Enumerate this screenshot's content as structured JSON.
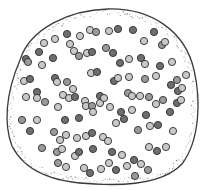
{
  "figure": {
    "width": 204,
    "height": 190,
    "background": "#ffffff",
    "outline": {
      "stroke": "#3a3a3a",
      "stroke_width": 1.3,
      "path": "M 20 60 C 30 28, 70 10, 108 9 C 150 8, 185 30, 194 70 C 201 100, 200 140, 182 164 C 165 182, 130 186, 95 184 C 55 183, 25 172, 12 146 C 4 125, 5 95, 20 60 Z",
      "stipple_color": "#6a6a6a"
    },
    "particle_radius": 3.6,
    "particle_stroke": "#2e2e2e",
    "shades": {
      "light": "#c9c9c9",
      "mid": "#9a9a9a",
      "dark": "#6e6e6e"
    },
    "particles": [
      [
        67,
        34,
        "dark"
      ],
      [
        80,
        36,
        "light"
      ],
      [
        90,
        30,
        "light"
      ],
      [
        96,
        32,
        "mid"
      ],
      [
        109,
        31,
        "light"
      ],
      [
        118,
        29,
        "dark"
      ],
      [
        133,
        30,
        "dark"
      ],
      [
        144,
        41,
        "light"
      ],
      [
        154,
        32,
        "dark"
      ],
      [
        162,
        45,
        "mid"
      ],
      [
        165,
        42,
        "light"
      ],
      [
        44,
        43,
        "light"
      ],
      [
        55,
        39,
        "light"
      ],
      [
        39,
        52,
        "dark"
      ],
      [
        53,
        58,
        "dark"
      ],
      [
        70,
        44,
        "light"
      ],
      [
        74,
        51,
        "light"
      ],
      [
        79,
        56,
        "mid"
      ],
      [
        26,
        59,
        "dark"
      ],
      [
        28,
        62,
        "mid"
      ],
      [
        42,
        65,
        "light"
      ],
      [
        87,
        53,
        "light"
      ],
      [
        92,
        52,
        "dark"
      ],
      [
        106,
        48,
        "mid"
      ],
      [
        113,
        53,
        "dark"
      ],
      [
        120,
        63,
        "dark"
      ],
      [
        129,
        59,
        "light"
      ],
      [
        141,
        58,
        "dark"
      ],
      [
        145,
        64,
        "light"
      ],
      [
        160,
        66,
        "dark"
      ],
      [
        172,
        62,
        "light"
      ],
      [
        24,
        81,
        "light"
      ],
      [
        30,
        79,
        "dark"
      ],
      [
        55,
        78,
        "dark"
      ],
      [
        57,
        82,
        "light"
      ],
      [
        67,
        82,
        "mid"
      ],
      [
        73,
        89,
        "light"
      ],
      [
        91,
        73,
        "light"
      ],
      [
        97,
        72,
        "dark"
      ],
      [
        114,
        81,
        "dark"
      ],
      [
        118,
        78,
        "light"
      ],
      [
        129,
        77,
        "light"
      ],
      [
        145,
        79,
        "mid"
      ],
      [
        156,
        76,
        "light"
      ],
      [
        177,
        80,
        "mid"
      ],
      [
        186,
        75,
        "light"
      ],
      [
        26,
        97,
        "light"
      ],
      [
        37,
        92,
        "dark"
      ],
      [
        37,
        98,
        "light"
      ],
      [
        45,
        102,
        "mid"
      ],
      [
        63,
        95,
        "light"
      ],
      [
        69,
        98,
        "light"
      ],
      [
        75,
        97,
        "dark"
      ],
      [
        85,
        101,
        "light"
      ],
      [
        100,
        96,
        "dark"
      ],
      [
        100,
        103,
        "light"
      ],
      [
        104,
        98,
        "light"
      ],
      [
        128,
        93,
        "mid"
      ],
      [
        132,
        96,
        "light"
      ],
      [
        140,
        96,
        "light"
      ],
      [
        149,
        97,
        "mid"
      ],
      [
        171,
        85,
        "dark"
      ],
      [
        178,
        91,
        "dark"
      ],
      [
        182,
        88,
        "light"
      ],
      [
        22,
        120,
        "mid"
      ],
      [
        37,
        120,
        "light"
      ],
      [
        58,
        107,
        "light"
      ],
      [
        65,
        120,
        "dark"
      ],
      [
        79,
        118,
        "dark"
      ],
      [
        86,
        106,
        "light"
      ],
      [
        92,
        106,
        "mid"
      ],
      [
        93,
        112,
        "light"
      ],
      [
        110,
        107,
        "light"
      ],
      [
        121,
        112,
        "dark"
      ],
      [
        132,
        110,
        "light"
      ],
      [
        146,
        115,
        "dark"
      ],
      [
        156,
        104,
        "light"
      ],
      [
        163,
        100,
        "mid"
      ],
      [
        170,
        112,
        "dark"
      ],
      [
        177,
        103,
        "dark"
      ],
      [
        181,
        100,
        "light"
      ],
      [
        30,
        131,
        "dark"
      ],
      [
        54,
        132,
        "mid"
      ],
      [
        60,
        140,
        "light"
      ],
      [
        66,
        135,
        "light"
      ],
      [
        77,
        138,
        "light"
      ],
      [
        86,
        136,
        "light"
      ],
      [
        92,
        133,
        "dark"
      ],
      [
        103,
        137,
        "light"
      ],
      [
        116,
        123,
        "light"
      ],
      [
        124,
        119,
        "dark"
      ],
      [
        138,
        130,
        "mid"
      ],
      [
        150,
        126,
        "light"
      ],
      [
        158,
        125,
        "dark"
      ],
      [
        173,
        131,
        "light"
      ],
      [
        42,
        148,
        "mid"
      ],
      [
        57,
        152,
        "mid"
      ],
      [
        62,
        149,
        "light"
      ],
      [
        75,
        156,
        "light"
      ],
      [
        79,
        152,
        "dark"
      ],
      [
        93,
        149,
        "dark"
      ],
      [
        108,
        141,
        "light"
      ],
      [
        112,
        152,
        "dark"
      ],
      [
        122,
        155,
        "light"
      ],
      [
        134,
        160,
        "dark"
      ],
      [
        141,
        164,
        "light"
      ],
      [
        149,
        147,
        "light"
      ],
      [
        157,
        151,
        "dark"
      ],
      [
        166,
        147,
        "light"
      ],
      [
        58,
        163,
        "mid"
      ],
      [
        66,
        167,
        "light"
      ],
      [
        84,
        168,
        "light"
      ],
      [
        90,
        173,
        "dark"
      ],
      [
        101,
        169,
        "light"
      ],
      [
        109,
        163,
        "light"
      ],
      [
        116,
        170,
        "dark"
      ],
      [
        127,
        166,
        "light"
      ],
      [
        135,
        176,
        "mid"
      ],
      [
        148,
        170,
        "mid"
      ]
    ]
  }
}
